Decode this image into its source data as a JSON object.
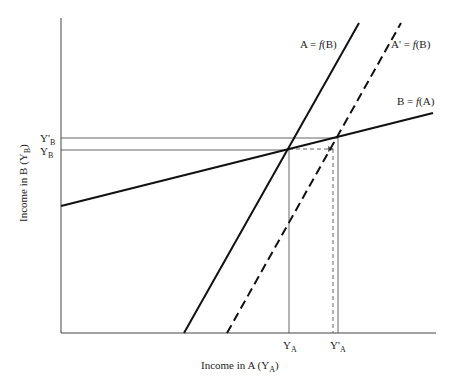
{
  "diagram": {
    "type": "economic-interdependence",
    "axes": {
      "x_label": "Income in A (Y",
      "x_label_sub": "A",
      "x_label_close": ")",
      "y_label": "Income in B (Y",
      "y_label_sub": "B",
      "y_label_close": ")"
    },
    "curves": [
      {
        "id": "a-fb",
        "label_main": "A = ",
        "label_f": "f",
        "label_arg": "(B)",
        "style": "solid"
      },
      {
        "id": "a-prime-fb",
        "label_main": "A' = ",
        "label_f": "f",
        "label_arg": "(B)",
        "style": "dashed"
      },
      {
        "id": "b-fa",
        "label_main": "B = ",
        "label_f": "f",
        "label_arg": "(A)",
        "style": "solid"
      }
    ],
    "y_ticks": [
      {
        "main": "Y'",
        "sub": "B"
      },
      {
        "main": "Y",
        "sub": "B"
      }
    ],
    "x_ticks": [
      {
        "main": "Y",
        "sub": "A"
      },
      {
        "main": "Y'",
        "sub": "A"
      }
    ]
  }
}
